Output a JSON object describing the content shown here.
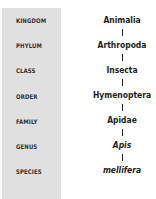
{
  "ranks": [
    "KINGDOM",
    "PHYLUM",
    "CLASS",
    "ORDER",
    "FAMILY",
    "GENUS",
    "SPECIES"
  ],
  "taxa": [
    "Animalia",
    "Arthropoda",
    "Insecta",
    "Hymenoptera",
    "Apidae",
    "Apis",
    "mellifera"
  ],
  "italic_levels": [
    "GENUS",
    "SPECIES"
  ],
  "colors": {
    "panel": "#e0e0e0",
    "text": "#1e1e1e"
  }
}
